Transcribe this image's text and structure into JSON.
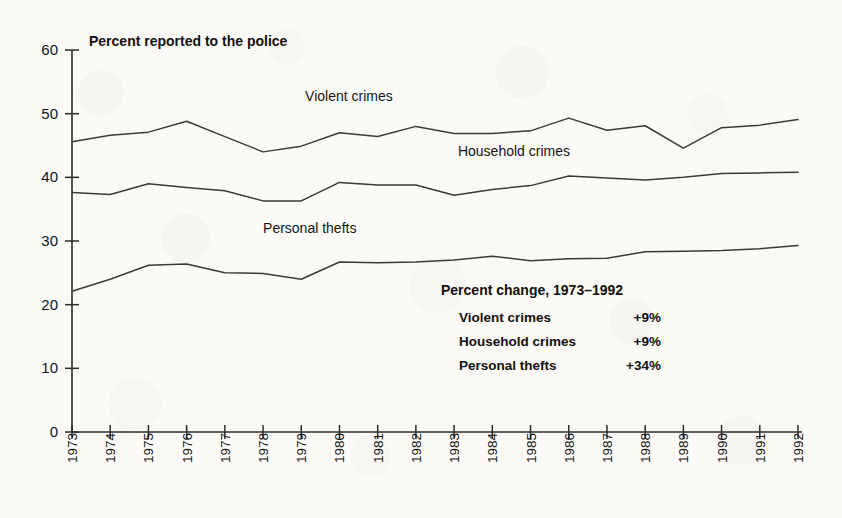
{
  "chart_data": {
    "type": "line",
    "title": "Percent reported to the police",
    "xlabel": "",
    "ylabel": "",
    "ylim": [
      0,
      60
    ],
    "yticks": [
      0,
      10,
      20,
      30,
      40,
      50,
      60
    ],
    "grid": false,
    "legend_position": "inline-labels",
    "x": [
      1973,
      1974,
      1975,
      1976,
      1977,
      1978,
      1979,
      1980,
      1981,
      1982,
      1983,
      1984,
      1985,
      1986,
      1987,
      1988,
      1989,
      1990,
      1991,
      1992
    ],
    "categories": [
      "1973",
      "1974",
      "1975",
      "1976",
      "1977",
      "1978",
      "1979",
      "1980",
      "1981",
      "1982",
      "1983",
      "1984",
      "1985",
      "1986",
      "1987",
      "1988",
      "1989",
      "1990",
      "1991",
      "1992"
    ],
    "series": [
      {
        "name": "Violent crimes",
        "values": [
          45.6,
          46.6,
          47.1,
          48.8,
          46.4,
          44.0,
          44.9,
          47.0,
          46.4,
          48.0,
          46.9,
          46.9,
          47.3,
          49.3,
          47.4,
          48.1,
          44.6,
          47.8,
          48.2,
          49.1
        ]
      },
      {
        "name": "Household crimes",
        "values": [
          37.6,
          37.3,
          39.0,
          38.4,
          37.9,
          36.3,
          36.3,
          39.2,
          38.8,
          38.8,
          37.2,
          38.1,
          38.7,
          40.2,
          39.9,
          39.6,
          40.0,
          40.6,
          40.7,
          40.8
        ]
      },
      {
        "name": "Personal thefts",
        "values": [
          22.1,
          24.0,
          26.2,
          26.4,
          25.0,
          24.9,
          24.0,
          26.7,
          26.6,
          26.7,
          27.0,
          27.6,
          26.9,
          27.2,
          27.3,
          28.3,
          28.4,
          28.5,
          28.8,
          29.3
        ]
      }
    ],
    "series_inline_labels": [
      {
        "text": "Violent crimes",
        "x": 1979.1,
        "y": 52.0
      },
      {
        "text": "Household crimes",
        "x": 1983.1,
        "y": 43.3
      },
      {
        "text": "Personal thefts",
        "x": 1978.0,
        "y": 31.3
      }
    ],
    "annotation": {
      "title": "Percent change, 1973–1992",
      "rows": [
        {
          "label": "Violent crimes",
          "value": "+9%"
        },
        {
          "label": "Household crimes",
          "value": "+9%"
        },
        {
          "label": "Personal thefts",
          "value": "+34%"
        }
      ]
    },
    "colors": {
      "line": "#3a3a3a",
      "axis": "#2b2b2b",
      "text": "#141414",
      "background": "#fbfaf7"
    }
  }
}
